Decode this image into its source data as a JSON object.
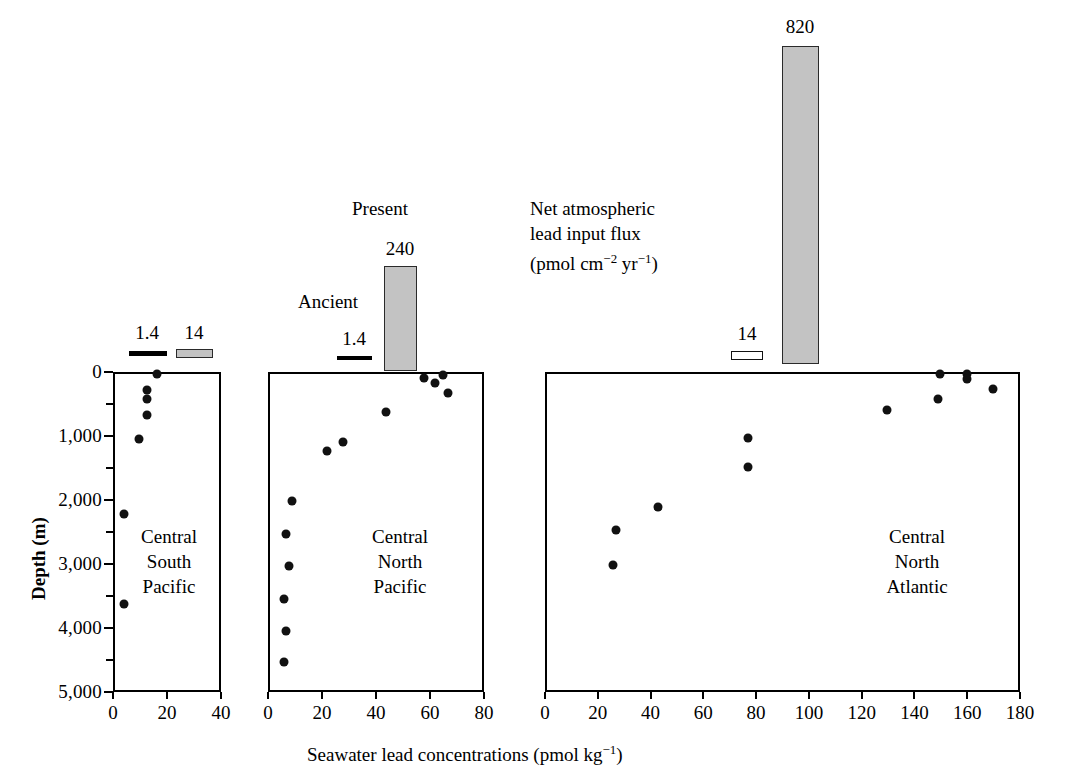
{
  "figure": {
    "xaxis_title_main": "Seawater lead concentrations (pmol kg",
    "xaxis_title_sup": "−1",
    "xaxis_title_tail": ")",
    "yaxis_title": "Depth (m)",
    "flux_note_line1": "Net atmospheric",
    "flux_note_line2": "lead input flux",
    "flux_note_line3_main": "(pmol cm",
    "flux_note_line3_sup1": "−2",
    "flux_note_line3_mid": " yr",
    "flux_note_line3_sup2": "−1",
    "flux_note_line3_tail": ")",
    "legend_ancient": "Ancient",
    "legend_present": "Present",
    "gray_fill": "#c3c3c3",
    "dot_color": "#111111",
    "axis_color": "#000000"
  },
  "chart_data": {
    "type": "scatter",
    "title": "",
    "xlabel": "Seawater lead concentrations (pmol kg−1)",
    "ylabel": "Depth (m)",
    "ylim": [
      0,
      5000
    ],
    "y_inverted": true,
    "y_ticks_major": [
      0,
      1000,
      2000,
      3000,
      4000,
      5000
    ],
    "y_ticks_major_labels": [
      "0",
      "1,000",
      "2,000",
      "3,000",
      "4,000",
      "5,000"
    ],
    "y_ticks_minor": [
      500,
      1500,
      2500,
      3500,
      4500
    ],
    "grid": false,
    "legend_position": "above-panels",
    "panels": [
      {
        "name": "Central South Pacific",
        "label_lines": [
          "Central",
          "South",
          "Pacific"
        ],
        "xlim": [
          0,
          40
        ],
        "x_ticks": [
          0,
          20,
          40
        ],
        "x_tick_labels": [
          "0",
          "20",
          "40"
        ],
        "points": [
          {
            "x": 15.5,
            "y": 0
          },
          {
            "x": 11.8,
            "y": 250
          },
          {
            "x": 11.8,
            "y": 390
          },
          {
            "x": 11.8,
            "y": 640
          },
          {
            "x": 9.0,
            "y": 1020
          },
          {
            "x": 3.4,
            "y": 2180
          },
          {
            "x": 3.4,
            "y": 3600
          }
        ],
        "flux_markers": [
          {
            "label": "1.4",
            "value": 1.4,
            "style": "solid-line",
            "x_center": 11.0
          },
          {
            "label": "14",
            "value": 14,
            "style": "gray-bar",
            "x_center": 28.5
          }
        ]
      },
      {
        "name": "Central North Pacific",
        "label_lines": [
          "Central",
          "North",
          "Pacific"
        ],
        "xlim": [
          0,
          80
        ],
        "x_ticks": [
          0,
          20,
          40,
          60,
          80
        ],
        "x_tick_labels": [
          "0",
          "20",
          "40",
          "60",
          "80"
        ],
        "points": [
          {
            "x": 64.0,
            "y": 10
          },
          {
            "x": 57.0,
            "y": 60
          },
          {
            "x": 61.0,
            "y": 140
          },
          {
            "x": 66.0,
            "y": 300
          },
          {
            "x": 43.0,
            "y": 600
          },
          {
            "x": 27.0,
            "y": 1060
          },
          {
            "x": 21.0,
            "y": 1200
          },
          {
            "x": 8.0,
            "y": 1980
          },
          {
            "x": 6.0,
            "y": 2500
          },
          {
            "x": 7.0,
            "y": 3000
          },
          {
            "x": 5.0,
            "y": 3520
          },
          {
            "x": 6.0,
            "y": 4020
          },
          {
            "x": 5.0,
            "y": 4500
          }
        ],
        "flux_markers": [
          {
            "label": "1.4",
            "value": 1.4,
            "style": "solid-line",
            "x_center": 13.5
          },
          {
            "label": "240",
            "value": 240,
            "style": "gray-bar-tall",
            "x_center": 30.0
          }
        ]
      },
      {
        "name": "Central North Atlantic",
        "label_lines": [
          "Central",
          "North",
          "Atlantic"
        ],
        "xlim": [
          0,
          180
        ],
        "x_ticks": [
          0,
          20,
          40,
          60,
          80,
          100,
          120,
          140,
          160,
          180
        ],
        "x_tick_labels": [
          "0",
          "20",
          "40",
          "60",
          "80",
          "100",
          "120",
          "140",
          "160",
          "180"
        ],
        "points": [
          {
            "x": 149.0,
            "y": 0
          },
          {
            "x": 159.0,
            "y": 0
          },
          {
            "x": 159.0,
            "y": 80
          },
          {
            "x": 169.0,
            "y": 240
          },
          {
            "x": 148.0,
            "y": 390
          },
          {
            "x": 129.0,
            "y": 560
          },
          {
            "x": 76.0,
            "y": 1000
          },
          {
            "x": 76.0,
            "y": 1450
          },
          {
            "x": 42.0,
            "y": 2080
          },
          {
            "x": 26.0,
            "y": 2430
          },
          {
            "x": 25.0,
            "y": 2980
          }
        ],
        "flux_markers": [
          {
            "label": "14",
            "value": 14,
            "style": "open-bar",
            "x_center": 70.5
          },
          {
            "label": "820",
            "value": 820,
            "style": "gray-bar-tall",
            "x_center": 90.5
          }
        ]
      }
    ]
  }
}
